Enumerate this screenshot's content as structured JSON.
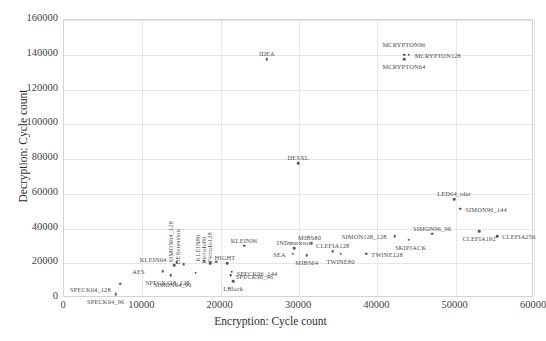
{
  "chart_data": {
    "type": "scatter",
    "title": "",
    "xlabel": "Encryption: Cycle count",
    "ylabel": "Decryption: Cycle count",
    "xlim": [
      0,
      60000
    ],
    "ylim": [
      0,
      160000
    ],
    "xticks": [
      "0",
      "10000",
      "20000",
      "30000",
      "40000",
      "50000",
      "60000"
    ],
    "yticks": [
      "0",
      "20000",
      "40000",
      "60000",
      "80000",
      "100000",
      "120000",
      "140000",
      "160000"
    ],
    "grid": true,
    "legend": "none",
    "marker_color": "#5a5a5a",
    "grid_color": "#e6e6e6",
    "points": [
      {
        "label": "SPECK64_96",
        "x": 6600,
        "y": 2200,
        "lx": -10,
        "ly": 9,
        "anchor": "center",
        "rot": 0
      },
      {
        "label": "SPECK64_128",
        "x": 7200,
        "y": 8200,
        "lx": -30,
        "ly": 7,
        "anchor": "center",
        "rot": 0
      },
      {
        "label": "AES",
        "x": 12600,
        "y": 15500,
        "lx": -16,
        "ly": 2,
        "anchor": "end",
        "rot": 0
      },
      {
        "label": "SIMON64_96",
        "x": 13600,
        "y": 13000,
        "lx": 2,
        "ly": 11,
        "anchor": "center",
        "rot": 0
      },
      {
        "label": "KLEIN64",
        "x": 14100,
        "y": 19000,
        "lx": -6,
        "ly": -4,
        "anchor": "end",
        "rot": 0
      },
      {
        "label": "SIMON64_128",
        "x": 14400,
        "y": 20500,
        "lx": -3,
        "ly": -6,
        "anchor": "start",
        "rot": 90
      },
      {
        "label": "DESxtension",
        "x": 15300,
        "y": 19500,
        "lx": -3,
        "ly": -6,
        "anchor": "start",
        "rot": 90
      },
      {
        "label": "SPECK128_128",
        "x": 16800,
        "y": 14500,
        "lx": -4,
        "ly": 11,
        "anchor": "end",
        "rot": 0
      },
      {
        "label": "KLEIN80",
        "x": 17900,
        "y": 21500,
        "lx": -3,
        "ly": -6,
        "anchor": "start",
        "rot": 90
      },
      {
        "label": "Piccolo80",
        "x": 18700,
        "y": 20000,
        "lx": -3,
        "ly": -6,
        "anchor": "start",
        "rot": 90
      },
      {
        "label": "Piccolo128",
        "x": 19400,
        "y": 21000,
        "lx": -3,
        "ly": -6,
        "anchor": "start",
        "rot": 90
      },
      {
        "label": "HIGHT",
        "x": 20800,
        "y": 20000,
        "lx": -2,
        "ly": -4,
        "anchor": "center",
        "rot": 0
      },
      {
        "label": "SPECK96_144",
        "x": 21400,
        "y": 15200,
        "lx": 5,
        "ly": 3,
        "anchor": "start",
        "rot": 0
      },
      {
        "label": "SPECK96_96",
        "x": 21300,
        "y": 13000,
        "lx": 5,
        "ly": 3,
        "anchor": "start",
        "rot": 0
      },
      {
        "label": "LBlock",
        "x": 21600,
        "y": 9500,
        "lx": 0,
        "ly": 9,
        "anchor": "center",
        "rot": 0
      },
      {
        "label": "KLEIN96",
        "x": 23000,
        "y": 30000,
        "lx": 0,
        "ly": -4,
        "anchor": "center",
        "rot": 0
      },
      {
        "label": "SEA",
        "x": 29200,
        "y": 25500,
        "lx": -5,
        "ly": 2,
        "anchor": "end",
        "rot": 0
      },
      {
        "label": "INDmarkson",
        "x": 29400,
        "y": 28700,
        "lx": 0,
        "ly": -4,
        "anchor": "center",
        "rot": 0
      },
      {
        "label": "MIBS64",
        "x": 31000,
        "y": 24500,
        "lx": 0,
        "ly": 9,
        "anchor": "center",
        "rot": 0
      },
      {
        "label": "MIBS80",
        "x": 31600,
        "y": 31500,
        "lx": -2,
        "ly": -4,
        "anchor": "center",
        "rot": 0
      },
      {
        "label": "CLEFIA128",
        "x": 34300,
        "y": 27000,
        "lx": 0,
        "ly": -4,
        "anchor": "center",
        "rot": 0
      },
      {
        "label": "TWINE80",
        "x": 35300,
        "y": 25500,
        "lx": 0,
        "ly": 9,
        "anchor": "center",
        "rot": 0
      },
      {
        "label": "TWINE128",
        "x": 38600,
        "y": 25500,
        "lx": 5,
        "ly": 2,
        "anchor": "start",
        "rot": 0
      },
      {
        "label": "SIMON128_128",
        "x": 42200,
        "y": 35500,
        "lx": -6,
        "ly": 2,
        "anchor": "end",
        "rot": 0
      },
      {
        "label": "SKIPJACK",
        "x": 44000,
        "y": 33500,
        "lx": 2,
        "ly": 9,
        "anchor": "center",
        "rot": 0
      },
      {
        "label": "SIMON96_96",
        "x": 47000,
        "y": 37000,
        "lx": 0,
        "ly": -4,
        "anchor": "center",
        "rot": 0
      },
      {
        "label": "LED64_tdur",
        "x": 49800,
        "y": 57000,
        "lx": 0,
        "ly": -4,
        "anchor": "center",
        "rot": 0
      },
      {
        "label": "SIMON96_144",
        "x": 50600,
        "y": 51500,
        "lx": 5,
        "ly": 2,
        "anchor": "start",
        "rot": 0
      },
      {
        "label": "CLEFIA192",
        "x": 53000,
        "y": 38500,
        "lx": 0,
        "ly": 9,
        "anchor": "center",
        "rot": 0
      },
      {
        "label": "CLEFIA256",
        "x": 55300,
        "y": 35500,
        "lx": 5,
        "ly": 2,
        "anchor": "start",
        "rot": 0
      },
      {
        "label": "IDEA",
        "x": 25900,
        "y": 137500,
        "lx": 0,
        "ly": -4,
        "anchor": "center",
        "rot": 0
      },
      {
        "label": "DESXL",
        "x": 29900,
        "y": 77500,
        "lx": 0,
        "ly": -4,
        "anchor": "center",
        "rot": 0
      },
      {
        "label": "MCRYPTON64",
        "x": 43400,
        "y": 137500,
        "lx": 0,
        "ly": 9,
        "anchor": "center",
        "rot": 0
      },
      {
        "label": "MCRYPTON96",
        "x": 43400,
        "y": 140000,
        "lx": 0,
        "ly": -9,
        "anchor": "center",
        "rot": 0
      },
      {
        "label": "MCRYPTON128",
        "x": 44000,
        "y": 140000,
        "lx": 6,
        "ly": 2,
        "anchor": "start",
        "rot": 0
      }
    ]
  }
}
